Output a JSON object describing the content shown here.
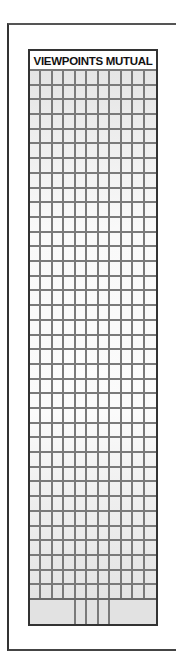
{
  "form": {
    "title": "VIEWPOINTS MUTUAL",
    "grid": {
      "columns": 11,
      "rows": 36
    },
    "footer": {
      "cells": [
        {
          "span_columns": 4
        },
        {
          "span_columns": 1
        },
        {
          "span_columns": 1
        },
        {
          "span_columns": 1
        },
        {
          "span_columns": 4
        }
      ]
    }
  },
  "colors": {
    "border": "#333333",
    "grid_line": "#7a7a7a",
    "cell_fill_edge": "#e4e4e4",
    "cell_fill_middle": "#fbfbfb"
  }
}
